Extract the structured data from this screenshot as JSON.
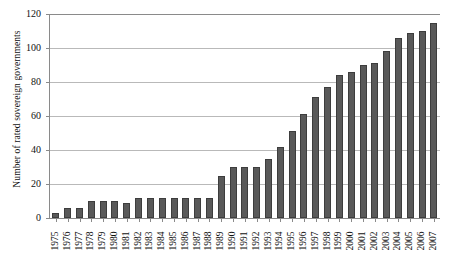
{
  "chart_data": {
    "type": "bar",
    "title": "",
    "xlabel": "",
    "ylabel": "Number of rated sovereign governments",
    "ylim": [
      0,
      120
    ],
    "ytick_step": 20,
    "yticks": [
      120,
      100,
      80,
      60,
      40,
      20,
      0
    ],
    "grid": true,
    "legend": false,
    "bar_color": "#595959",
    "categories": [
      "1975",
      "1976",
      "1977",
      "1978",
      "1979",
      "1980",
      "1981",
      "1982",
      "1983",
      "1984",
      "1985",
      "1986",
      "1987",
      "1988",
      "1989",
      "1990",
      "1991",
      "1992",
      "1993",
      "1994",
      "1995",
      "1996",
      "1997",
      "1998",
      "1999",
      "2000",
      "2001",
      "2002",
      "2003",
      "2004",
      "2005",
      "2006",
      "2007"
    ],
    "values": [
      3,
      6,
      6,
      10,
      10,
      10,
      9,
      12,
      12,
      12,
      12,
      12,
      12,
      12,
      25,
      30,
      30,
      30,
      35,
      42,
      51,
      61,
      71,
      77,
      84,
      86,
      90,
      91,
      98,
      106,
      109,
      110,
      115
    ]
  }
}
